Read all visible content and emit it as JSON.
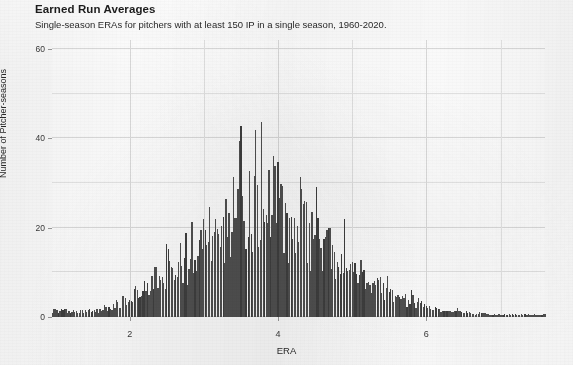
{
  "chart_data": {
    "type": "bar",
    "title": "Earned Run Averages",
    "subtitle": "Single-season ERAs for pitchers with at least 150 IP in a single season, 1960-2020.",
    "xlabel": "ERA",
    "ylabel": "Number of Pitcher-seasons",
    "xlim": [
      0.95,
      7.6
    ],
    "ylim": [
      0,
      62
    ],
    "xticks": [
      2,
      4,
      6
    ],
    "yticks": [
      0,
      20,
      40,
      60
    ],
    "grid": true,
    "legend": false,
    "bin_width": 0.02,
    "bar_color": "#4c4c4c",
    "panel_background": "#ffffff",
    "note": "Fine-binned histogram of single-season ERA; tall narrow spikes occur at round ERA values (e.g. 3.00, 3.50, 4.00) because ERAs are reported to two decimals.",
    "x": [
      1.12,
      1.6,
      1.64,
      1.68,
      1.74,
      1.78,
      1.82,
      1.86,
      1.9,
      1.94,
      1.98,
      2.02,
      2.06,
      2.1,
      2.14,
      2.18,
      2.22,
      2.26,
      2.3,
      2.34,
      2.38,
      2.42,
      2.46,
      2.5,
      2.54,
      2.58,
      2.62,
      2.66,
      2.7,
      2.74,
      2.78,
      2.82,
      2.86,
      2.9,
      2.94,
      2.98,
      3.02,
      3.06,
      3.1,
      3.14,
      3.18,
      3.22,
      3.26,
      3.3,
      3.34,
      3.38,
      3.42,
      3.46,
      3.5,
      3.54,
      3.58,
      3.62,
      3.66,
      3.7,
      3.74,
      3.78,
      3.82,
      3.86,
      3.9,
      3.94,
      3.98,
      4.02,
      4.06,
      4.1,
      4.14,
      4.18,
      4.22,
      4.26,
      4.3,
      4.34,
      4.38,
      4.42,
      4.46,
      4.5,
      4.54,
      4.58,
      4.62,
      4.66,
      4.7,
      4.74,
      4.78,
      4.82,
      4.86,
      4.9,
      4.94,
      4.98,
      5.02,
      5.06,
      5.1,
      5.14,
      5.18,
      5.22,
      5.26,
      5.3,
      5.34,
      5.38,
      5.42,
      5.46,
      5.5,
      5.54,
      5.58,
      5.62,
      5.66,
      5.7,
      5.74,
      5.78,
      5.82,
      5.86,
      5.9,
      5.94,
      5.98,
      6.02,
      6.08,
      6.14,
      6.2,
      6.26,
      6.32,
      6.4,
      6.48,
      6.56,
      6.64,
      6.74,
      6.86,
      6.98,
      7.12,
      7.26,
      7.38
    ],
    "values": [
      2,
      2,
      3,
      3,
      2,
      4,
      5,
      3,
      6,
      4,
      7,
      5,
      9,
      6,
      8,
      11,
      7,
      12,
      9,
      14,
      10,
      16,
      11,
      19,
      13,
      17,
      12,
      20,
      14,
      22,
      15,
      24,
      16,
      27,
      18,
      30,
      20,
      28,
      19,
      34,
      21,
      31,
      22,
      38,
      23,
      36,
      24,
      42,
      47,
      30,
      26,
      44,
      28,
      54,
      31,
      58,
      29,
      46,
      36,
      41,
      33,
      48,
      27,
      39,
      25,
      35,
      23,
      33,
      42,
      26,
      30,
      22,
      28,
      34,
      20,
      26,
      18,
      24,
      28,
      17,
      21,
      15,
      19,
      24,
      14,
      18,
      20,
      12,
      16,
      10,
      14,
      9,
      12,
      15,
      8,
      11,
      7,
      10,
      12,
      6,
      9,
      5,
      8,
      6,
      4,
      7,
      5,
      3,
      6,
      4,
      5,
      4,
      3,
      4,
      2,
      3,
      2,
      3,
      2,
      2,
      1,
      2,
      1,
      1,
      1,
      1,
      1
    ]
  },
  "axes": {
    "y_tick_labels": [
      "0",
      "20",
      "40",
      "60"
    ],
    "x_tick_labels": [
      "2",
      "4",
      "6"
    ]
  }
}
